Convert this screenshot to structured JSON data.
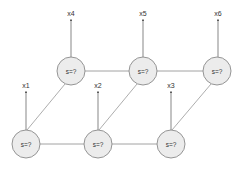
{
  "diagram": {
    "type": "graphical-model",
    "node_fill": "#ececec",
    "node_stroke": "#8a8a8a",
    "edge_color": "#8a8a8a",
    "nodes": [
      {
        "id": "s_top_1",
        "label": "s=?",
        "cx": 71,
        "cy": 71
      },
      {
        "id": "s_top_2",
        "label": "s=?",
        "cx": 143,
        "cy": 71
      },
      {
        "id": "s_top_3",
        "label": "s=?",
        "cx": 217,
        "cy": 71
      },
      {
        "id": "s_bot_1",
        "label": "s=?",
        "cx": 26,
        "cy": 144
      },
      {
        "id": "s_bot_2",
        "label": "s=?",
        "cx": 98,
        "cy": 144
      },
      {
        "id": "s_bot_3",
        "label": "s=?",
        "cx": 171,
        "cy": 144
      }
    ],
    "observations": [
      {
        "label": "x4",
        "node": "s_top_1"
      },
      {
        "label": "x5",
        "node": "s_top_2"
      },
      {
        "label": "x6",
        "node": "s_top_3"
      },
      {
        "label": "x1",
        "node": "s_bot_1"
      },
      {
        "label": "x2",
        "node": "s_bot_2"
      },
      {
        "label": "x3",
        "node": "s_bot_3"
      }
    ]
  }
}
